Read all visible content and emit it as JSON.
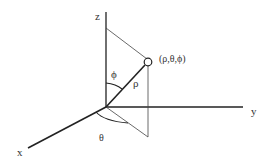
{
  "diagram": {
    "axes": {
      "x": "x",
      "y": "y",
      "z": "z"
    },
    "point_label": "(ρ,θ,ϕ)",
    "radius_label": "ρ",
    "polar_angle_label": "ϕ",
    "azimuth_angle_label": "θ"
  }
}
